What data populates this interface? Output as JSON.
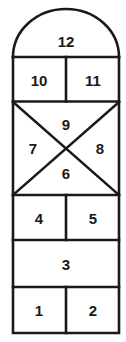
{
  "diagram": {
    "shape_name": "hopscotch-court",
    "background_color": "#ffffff",
    "line_color": "#1a1a1a",
    "number_color": "#1a1a1a",
    "cells": [
      {
        "id": "cell-12",
        "label": "12",
        "shape": "arch-top",
        "cx": 66,
        "cy": 40
      },
      {
        "id": "cell-10",
        "label": "10",
        "shape": "rect-left",
        "cx": 39,
        "cy": 79
      },
      {
        "id": "cell-11",
        "label": "11",
        "shape": "rect-right",
        "cx": 93,
        "cy": 79
      },
      {
        "id": "cell-9",
        "label": "9",
        "shape": "triangle-top",
        "cx": 66,
        "cy": 124
      },
      {
        "id": "cell-7",
        "label": "7",
        "shape": "triangle-left",
        "cx": 33,
        "cy": 148
      },
      {
        "id": "cell-8",
        "label": "8",
        "shape": "triangle-right",
        "cx": 100,
        "cy": 148
      },
      {
        "id": "cell-6",
        "label": "6",
        "shape": "triangle-bottom",
        "cx": 66,
        "cy": 173
      },
      {
        "id": "cell-4",
        "label": "4",
        "shape": "rect-left",
        "cx": 39,
        "cy": 218
      },
      {
        "id": "cell-5",
        "label": "5",
        "shape": "rect-right",
        "cx": 93,
        "cy": 218
      },
      {
        "id": "cell-3",
        "label": "3",
        "shape": "rect-full",
        "cx": 66,
        "cy": 264
      },
      {
        "id": "cell-1",
        "label": "1",
        "shape": "rect-left",
        "cx": 39,
        "cy": 310
      },
      {
        "id": "cell-2",
        "label": "2",
        "shape": "rect-right",
        "cx": 93,
        "cy": 310
      }
    ]
  }
}
